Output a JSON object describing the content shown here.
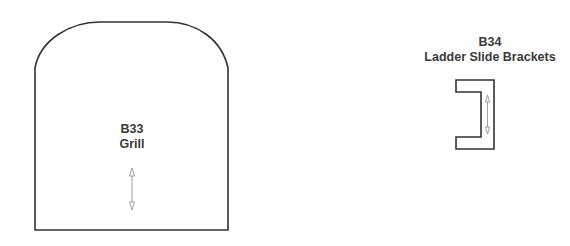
{
  "parts": [
    {
      "id": "B33",
      "name": "Grill",
      "shape": "rounded-top-panel",
      "arrow": "vertical-double-arrow"
    },
    {
      "id": "B34",
      "name": "Ladder Slide Brackets",
      "shape": "c-bracket",
      "arrow": "vertical-double-arrow"
    }
  ],
  "colors": {
    "stroke": "#333333",
    "arrow": "#777777",
    "text": "#3a3a3a",
    "background": "#ffffff"
  }
}
